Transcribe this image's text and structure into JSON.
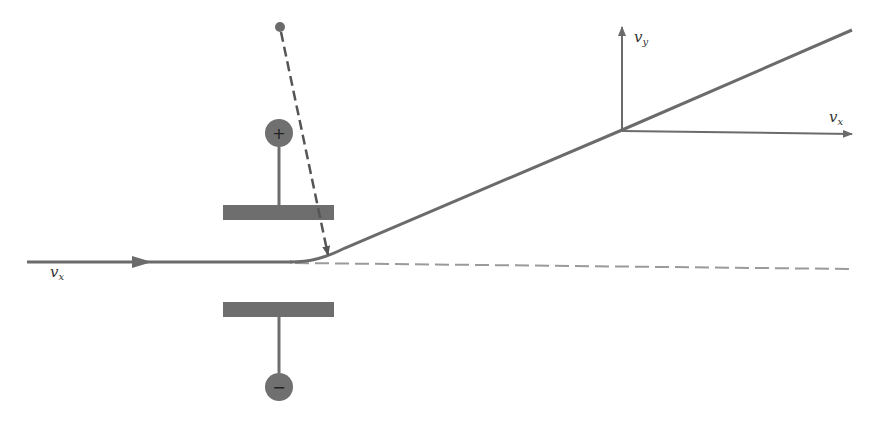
{
  "diagram": {
    "type": "charged-particle-deflection-between-plates",
    "labels": {
      "incoming_velocity": {
        "main": "v",
        "sub": "x"
      },
      "exit_vy": {
        "main": "v",
        "sub": "y"
      },
      "exit_vx": {
        "main": "v",
        "sub": "x"
      }
    },
    "terminals": {
      "positive": "+",
      "negative": "−"
    },
    "colors": {
      "line": "#6b6b6b",
      "plate": "#6e6e6e",
      "terminal": "#707070",
      "dashed": "#9a9a9a",
      "background": "#ffffff"
    }
  }
}
